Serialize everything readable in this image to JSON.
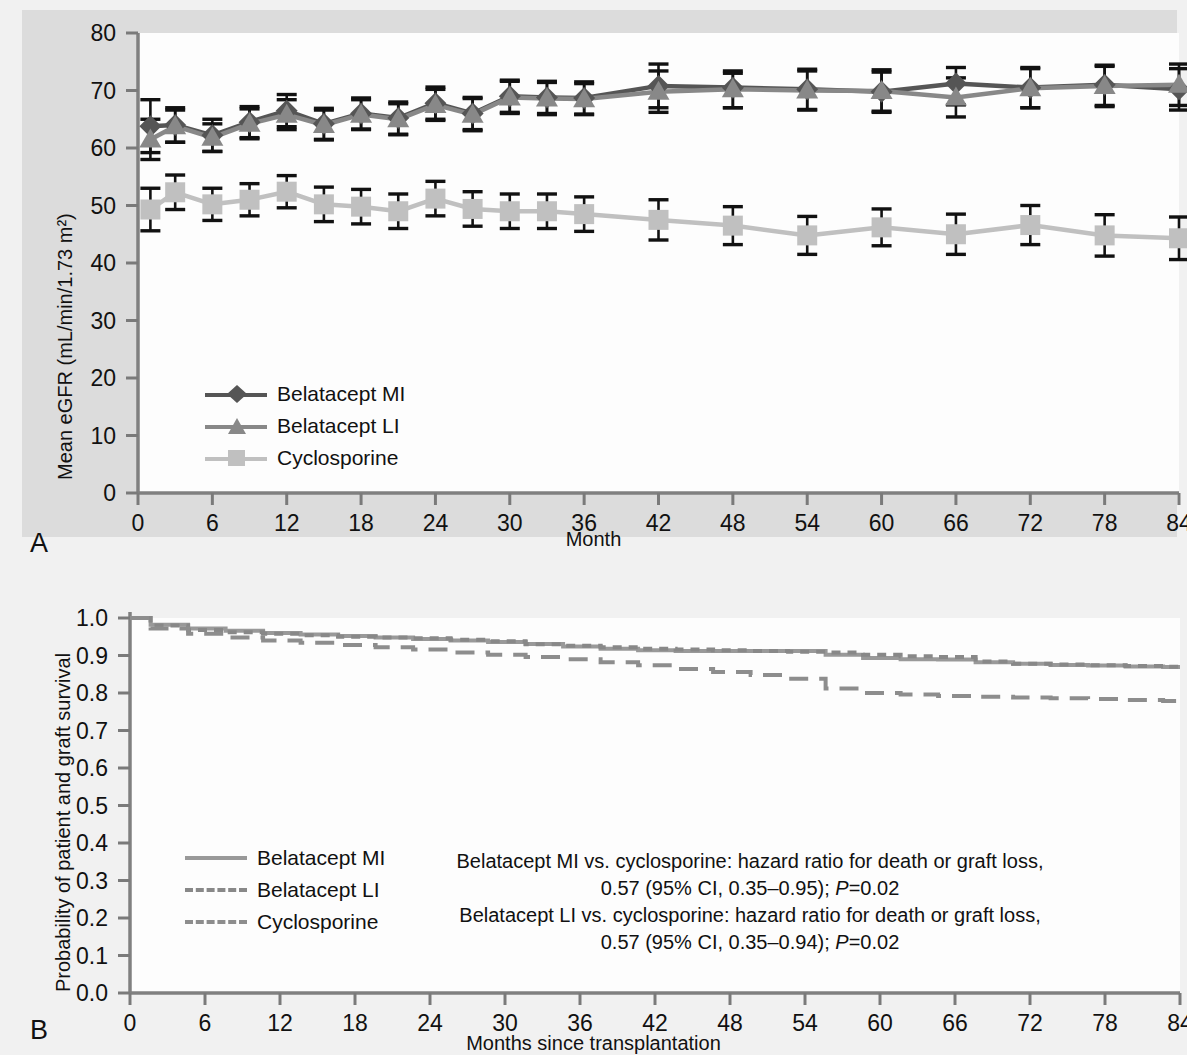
{
  "figure": {
    "panelA_letter": "A",
    "panelB_letter": "B"
  },
  "colors": {
    "belatacept_mi": "#555555",
    "belatacept_li": "#888888",
    "cyclosporine": "#c0c0c0",
    "errorbar": "#111111",
    "axis": "#808080",
    "panel_background": "#dcdcdc",
    "plot_background": "#fdfdfd"
  },
  "panelA": {
    "ylabel": "Mean eGFR (mL/min/1.73 m²)",
    "xlabel": "Month",
    "legend": [
      {
        "label": "Belatacept MI",
        "marker": "diamond",
        "color": "#555555"
      },
      {
        "label": "Belatacept LI",
        "marker": "triangle",
        "color": "#888888"
      },
      {
        "label": "Cyclosporine",
        "marker": "square",
        "color": "#c0c0c0"
      }
    ]
  },
  "panelB": {
    "ylabel": "Probability of patient and graft survival",
    "xlabel": "Months since transplantation",
    "legend": [
      {
        "label": "Belatacept MI",
        "style": "solid",
        "color": "#999999"
      },
      {
        "label": "Belatacept LI",
        "style": "dotted",
        "color": "#888888"
      },
      {
        "label": "Cyclosporine",
        "style": "dashed",
        "color": "#8d8d8d"
      }
    ],
    "annotation": {
      "line1": "Belatacept MI vs. cyclosporine: hazard ratio for death or graft loss,",
      "line2_pre": "0.57 (95% CI, 0.35–0.95); ",
      "line2_italic": "P",
      "line2_post": "=0.02",
      "line3": "Belatacept LI vs. cyclosporine: hazard ratio for death or graft loss,",
      "line4_pre": "0.57 (95% CI, 0.35–0.94); ",
      "line4_italic": "P",
      "line4_post": "=0.02"
    }
  },
  "chart_data": [
    {
      "type": "line",
      "panel": "A",
      "title": "",
      "xlabel": "Month",
      "ylabel": "Mean eGFR (mL/min/1.73 m²)",
      "xlim": [
        0,
        84
      ],
      "ylim": [
        0,
        80
      ],
      "xticks": [
        0,
        6,
        12,
        18,
        24,
        30,
        36,
        42,
        48,
        54,
        60,
        66,
        72,
        78,
        84
      ],
      "yticks": [
        0,
        10,
        20,
        30,
        40,
        50,
        60,
        70,
        80
      ],
      "grid": false,
      "legend_position": "lower-left",
      "error_bars": true,
      "x": [
        1,
        3,
        6,
        9,
        12,
        15,
        18,
        21,
        24,
        27,
        30,
        33,
        36,
        42,
        48,
        54,
        60,
        66,
        72,
        78,
        84
      ],
      "series": [
        {
          "name": "Belatacept MI",
          "marker": "diamond",
          "color": "#555555",
          "values": [
            63.8,
            64.0,
            62.2,
            64.5,
            66.5,
            64.2,
            66.0,
            65.2,
            67.8,
            66.0,
            69.0,
            68.8,
            68.7,
            70.8,
            70.5,
            70.2,
            69.8,
            71.2,
            70.5,
            71.0,
            70.2
          ],
          "err_lo": [
            59.2,
            61.0,
            59.4,
            61.8,
            63.7,
            61.5,
            63.3,
            62.4,
            65.0,
            63.2,
            66.2,
            66.0,
            65.9,
            67.0,
            67.0,
            66.7,
            66.4,
            67.5,
            67.0,
            67.4,
            66.6
          ],
          "err_hi": [
            68.4,
            67.0,
            65.0,
            67.2,
            69.3,
            66.9,
            68.7,
            68.0,
            70.6,
            68.8,
            71.8,
            71.6,
            71.5,
            74.6,
            73.0,
            73.7,
            73.2,
            74.0,
            74.0,
            74.2,
            73.8
          ]
        },
        {
          "name": "Belatacept LI",
          "marker": "triangle",
          "color": "#888888",
          "values": [
            61.5,
            63.8,
            61.8,
            64.2,
            65.8,
            64.0,
            65.8,
            65.0,
            67.5,
            65.8,
            68.8,
            68.6,
            68.5,
            69.8,
            70.2,
            70.0,
            69.9,
            68.8,
            70.4,
            70.8,
            71.0
          ],
          "err_lo": [
            58.0,
            61.0,
            59.4,
            61.6,
            63.2,
            61.4,
            63.2,
            62.3,
            64.8,
            63.0,
            66.0,
            65.8,
            65.8,
            66.2,
            67.0,
            66.6,
            66.2,
            65.4,
            67.0,
            67.2,
            67.4
          ],
          "err_hi": [
            65.0,
            66.6,
            64.2,
            66.8,
            68.4,
            66.6,
            68.4,
            67.7,
            70.2,
            68.6,
            71.6,
            71.4,
            71.2,
            73.4,
            73.4,
            73.4,
            73.6,
            72.2,
            73.8,
            74.4,
            74.6
          ]
        },
        {
          "name": "Cyclosporine",
          "marker": "square",
          "color": "#c0c0c0",
          "values": [
            49.3,
            52.3,
            50.2,
            51.0,
            52.4,
            50.2,
            49.8,
            49.0,
            51.2,
            49.4,
            49.0,
            49.0,
            48.5,
            47.5,
            46.5,
            44.8,
            46.2,
            45.0,
            46.6,
            44.8,
            44.3
          ],
          "err_lo": [
            45.6,
            49.3,
            47.4,
            48.2,
            49.6,
            47.2,
            46.8,
            46.0,
            48.2,
            46.4,
            46.0,
            46.0,
            45.5,
            44.0,
            43.2,
            41.5,
            43.0,
            41.5,
            43.2,
            41.2,
            40.6
          ],
          "err_hi": [
            53.0,
            55.3,
            53.0,
            53.8,
            55.2,
            53.2,
            52.8,
            52.0,
            54.2,
            52.4,
            52.0,
            52.0,
            51.5,
            51.0,
            49.8,
            48.1,
            49.4,
            48.5,
            50.0,
            48.4,
            48.0
          ]
        }
      ]
    },
    {
      "type": "line",
      "panel": "B",
      "title": "",
      "xlabel": "Months since transplantation",
      "ylabel": "Probability of patient and graft survival",
      "xlim": [
        0,
        84
      ],
      "ylim": [
        0.0,
        1.0
      ],
      "xticks": [
        0,
        6,
        12,
        18,
        24,
        30,
        36,
        42,
        48,
        54,
        60,
        66,
        72,
        78,
        84
      ],
      "yticks": [
        0.0,
        0.1,
        0.2,
        0.3,
        0.4,
        0.5,
        0.6,
        0.7,
        0.8,
        0.9,
        1.0
      ],
      "grid": false,
      "legend_position": "lower-left",
      "x": [
        0,
        3,
        6,
        9,
        12,
        15,
        18,
        21,
        24,
        27,
        30,
        33,
        36,
        39,
        42,
        45,
        48,
        51,
        54,
        57,
        60,
        63,
        66,
        69,
        72,
        75,
        78,
        81,
        84
      ],
      "series": [
        {
          "name": "Belatacept MI",
          "style": "solid",
          "color": "#999999",
          "values": [
            1.0,
            0.982,
            0.972,
            0.966,
            0.96,
            0.956,
            0.952,
            0.948,
            0.944,
            0.94,
            0.936,
            0.931,
            0.924,
            0.918,
            0.914,
            0.912,
            0.912,
            0.912,
            0.912,
            0.902,
            0.893,
            0.89,
            0.889,
            0.882,
            0.878,
            0.875,
            0.873,
            0.871,
            0.869
          ]
        },
        {
          "name": "Belatacept LI",
          "style": "dotted",
          "color": "#888888",
          "values": [
            1.0,
            0.98,
            0.968,
            0.962,
            0.958,
            0.954,
            0.95,
            0.948,
            0.946,
            0.942,
            0.938,
            0.93,
            0.926,
            0.922,
            0.918,
            0.916,
            0.914,
            0.912,
            0.91,
            0.908,
            0.902,
            0.898,
            0.896,
            0.884,
            0.878,
            0.876,
            0.874,
            0.872,
            0.87
          ]
        },
        {
          "name": "Cyclosporine",
          "style": "dashed",
          "color": "#8d8d8d",
          "values": [
            1.0,
            0.972,
            0.958,
            0.948,
            0.94,
            0.934,
            0.928,
            0.922,
            0.916,
            0.908,
            0.902,
            0.896,
            0.89,
            0.882,
            0.874,
            0.864,
            0.856,
            0.848,
            0.838,
            0.812,
            0.8,
            0.796,
            0.792,
            0.79,
            0.788,
            0.786,
            0.784,
            0.781,
            0.779
          ]
        }
      ]
    }
  ]
}
